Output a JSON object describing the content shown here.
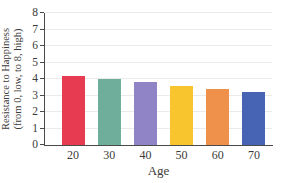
{
  "chart_data": {
    "type": "bar",
    "title": "",
    "xlabel": "Age",
    "ylabel": "Resistance to Happiness (from 0, low, to 8, high)",
    "ylabel_line1": "Resistance to Happiness",
    "ylabel_line2": "(from 0, low, to 8, high)",
    "categories": [
      "20",
      "30",
      "40",
      "50",
      "60",
      "70"
    ],
    "values": [
      4.2,
      4.0,
      3.8,
      3.6,
      3.4,
      3.2
    ],
    "bar_colors": [
      "#E73B52",
      "#6FAE9B",
      "#9184C6",
      "#F8C52F",
      "#F0914B",
      "#4763B4"
    ],
    "ylim": [
      0,
      8
    ],
    "yticks": [
      0,
      1,
      2,
      3,
      4,
      5,
      6,
      7,
      8
    ],
    "grid": "horizontal",
    "legend": "none",
    "colors": {
      "gridline": "#EAEAE7",
      "axis": "#4A4A48",
      "text": "#3B3B39",
      "background": "#FFFFFF"
    }
  }
}
